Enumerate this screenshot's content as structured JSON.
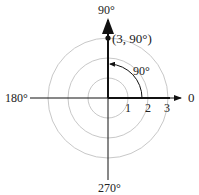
{
  "diagram": {
    "type": "polar-coordinate-plot",
    "angle_labels": {
      "right": "0",
      "top": "90°",
      "left": "180°",
      "bottom": "270°"
    },
    "radial_ticks": [
      "1",
      "2",
      "3"
    ],
    "circles": [
      1,
      2,
      3
    ],
    "point": {
      "r": 3,
      "theta_deg": 90,
      "label": "(3, 90°)"
    },
    "angle_arc": {
      "from_deg": 0,
      "to_deg": 90,
      "label": "90°"
    },
    "colors": {
      "axis": "#111111",
      "circle": "#c8c8c8",
      "text": "#222222"
    }
  }
}
